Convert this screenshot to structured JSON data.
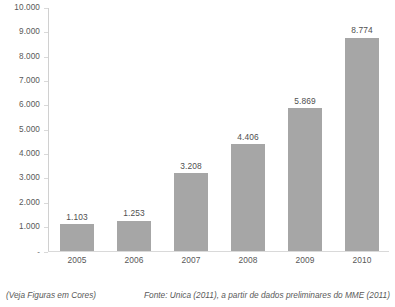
{
  "chart_data": {
    "type": "bar",
    "title": "",
    "subtitle": "",
    "xlabel": "",
    "ylabel": "",
    "categories": [
      "2005",
      "2006",
      "2007",
      "2008",
      "2009",
      "2010"
    ],
    "values": [
      1103,
      1253,
      3208,
      4406,
      5869,
      8774
    ],
    "value_labels": [
      "1.103",
      "1.253",
      "3.208",
      "4.406",
      "5.869",
      "8.774"
    ],
    "series": [
      {
        "name": "",
        "values": [
          1103,
          1253,
          3208,
          4406,
          5869,
          8774
        ]
      }
    ],
    "ylim": [
      0,
      10000
    ],
    "y_ticks": [
      0,
      1000,
      2000,
      3000,
      4000,
      5000,
      6000,
      7000,
      8000,
      9000,
      10000
    ],
    "y_tick_labels": [
      "-",
      "1.000",
      "2.000",
      "3.000",
      "4.000",
      "5.000",
      "6.000",
      "7.000",
      "8.000",
      "9.000",
      "10.000"
    ],
    "grid": false,
    "legend": false,
    "legend_position": "none",
    "bar_color": "#a6a6a6",
    "axis_color": "#d9d9d9",
    "background_color": "#ffffff",
    "text_color": "#585858"
  },
  "footer": {
    "note": "(Veja Figuras em Cores)",
    "source": "Fonte: Unica (2011), a partir de dados preliminares do MME (2011)"
  }
}
